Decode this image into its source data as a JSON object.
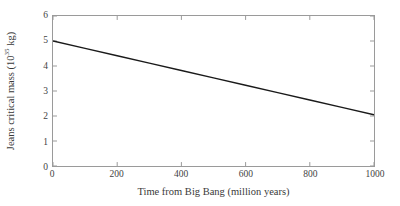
{
  "chart_data": {
    "type": "line",
    "title": "",
    "xlabel": "Time from Big Bang (million years)",
    "ylabel_prefix": "Jeans critical mass (10",
    "ylabel_exponent": "35",
    "ylabel_suffix": " kg)",
    "ylabel_plain": "Jeans critical mass (10^35 kg)",
    "xlim": [
      0,
      1000
    ],
    "ylim": [
      0,
      6
    ],
    "xticks": [
      0,
      200,
      400,
      600,
      800,
      1000
    ],
    "xtick_labels": [
      "0",
      "200",
      "400",
      "600",
      "800",
      "1000"
    ],
    "yticks": [
      0,
      1,
      2,
      3,
      4,
      5,
      6
    ],
    "ytick_labels": [
      "0",
      "1",
      "2",
      "3",
      "4",
      "5",
      "6"
    ],
    "grid": false,
    "legend": "none",
    "frame": "box",
    "tick_direction": "in",
    "line_color": "#1a1a1a",
    "line_width": 1.5,
    "series": [
      {
        "name": "Jeans critical mass",
        "x": [
          0,
          100,
          200,
          300,
          400,
          500,
          600,
          700,
          800,
          900,
          1000
        ],
        "values": [
          5.0,
          4.705,
          4.41,
          4.115,
          3.82,
          3.525,
          3.23,
          2.935,
          2.64,
          2.345,
          2.05
        ]
      }
    ]
  }
}
